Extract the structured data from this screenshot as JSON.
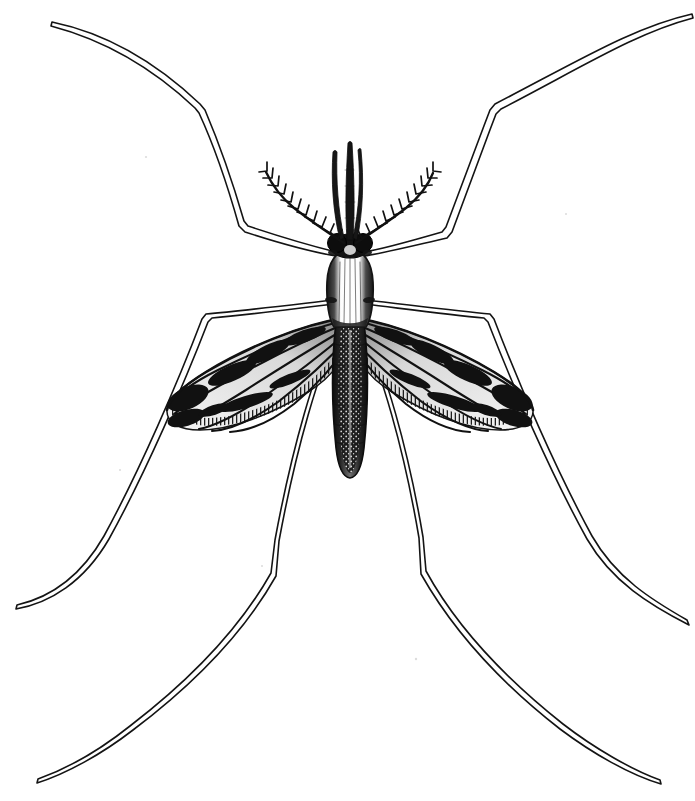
{
  "figure": {
    "domain": "Natural-Image",
    "style": "vintage black-and-white line engraving / stipple illustration",
    "caption": "",
    "background_color": "#ffffff",
    "ink_color": "#111111",
    "canvas": {
      "width": 695,
      "height": 801
    },
    "orientation": "dorsal view, head up, abdomen down",
    "sex_indicator": "male (plumose feathery antennae)"
  },
  "anatomy": {
    "proboscis": {
      "name": "proboscis",
      "description": "central slender dark shaft projecting upward from head",
      "tip": [
        347,
        143
      ],
      "base": [
        350,
        240
      ]
    },
    "palps": {
      "name": "maxillary palps",
      "count": 2,
      "description": "pair of shafts flanking the proboscis, slightly shorter",
      "left_tip": [
        333,
        152
      ],
      "right_tip": [
        361,
        150
      ]
    },
    "antennae": {
      "name": "plumose antennae",
      "count": 2,
      "segments_per_antenna": 11,
      "description": "curving shafts bearing paired whorls of fine hairs at each segment",
      "left_tip": [
        266,
        171
      ],
      "right_tip": [
        433,
        173
      ],
      "base": [
        350,
        243
      ]
    },
    "head": {
      "name": "head",
      "description": "compact dark head with two rounded compound-eye lobes",
      "center": [
        350,
        245
      ],
      "width": 36,
      "height": 20
    },
    "thorax": {
      "name": "thorax",
      "description": "oval pale dorsum with dark shaded margins and fine longitudinal striations",
      "center": [
        350,
        288
      ],
      "width": 42,
      "height": 78
    },
    "abdomen": {
      "name": "abdomen",
      "description": "long tapering dark segmented abdomen with stippled pale midline, blunt tip",
      "top": [
        350,
        325
      ],
      "tip": [
        350,
        478
      ],
      "max_width": 30,
      "segments": 8
    },
    "wings": {
      "name": "wings",
      "count": 2,
      "description": "long narrow scaled wings, rounded tips, dark mottled patches along veins, comb-like fringe on trailing edge",
      "veins_per_wing": 6,
      "left_wing": {
        "base": [
          342,
          320
        ],
        "tip": [
          176,
          408
        ],
        "length": 188
      },
      "right_wing": {
        "base": [
          358,
          320
        ],
        "tip": [
          522,
          408
        ],
        "length": 188
      }
    },
    "legs": {
      "name": "legs",
      "count": 6,
      "description": "six very long slender legs drawn as thin double-line outlines, each with a sharp knee bend and tapering tarsus",
      "items": [
        {
          "id": "foreleg-left",
          "label": "left foreleg",
          "tip": [
            52,
            22
          ],
          "knee": [
            203,
            107
          ],
          "joint": [
            243,
            222
          ],
          "attachment": [
            336,
            252
          ]
        },
        {
          "id": "foreleg-right",
          "label": "right foreleg",
          "tip": [
            692,
            14
          ],
          "knee": [
            492,
            108
          ],
          "joint": [
            445,
            228
          ],
          "attachment": [
            364,
            252
          ]
        },
        {
          "id": "midleg-left",
          "label": "left midleg",
          "tip": [
            16,
            606
          ],
          "knee": [
            204,
            315
          ],
          "attachment": [
            334,
            300
          ]
        },
        {
          "id": "midleg-right",
          "label": "right midleg",
          "tip": [
            688,
            622
          ],
          "knee": [
            492,
            318
          ],
          "attachment": [
            366,
            300
          ]
        },
        {
          "id": "hindleg-left",
          "label": "left hindleg",
          "tip": [
            37,
            781
          ],
          "knee": [
            272,
            576
          ],
          "attachment": [
            338,
            322
          ]
        },
        {
          "id": "hindleg-right",
          "label": "right hindleg",
          "tip": [
            661,
            783
          ],
          "knee": [
            423,
            573
          ],
          "attachment": [
            362,
            322
          ]
        }
      ]
    }
  }
}
